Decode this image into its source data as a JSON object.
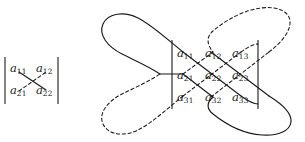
{
  "figure": {
    "background_color": "#ffffff",
    "stroke_color": "#1a1a1a",
    "text_color": "#1a1a1a",
    "solid_line_meaning": "positive products (down-right diagonals)",
    "dashed_line_meaning": "negative products (up-right diagonals)"
  },
  "determinant_2x2": {
    "name": "2x2 determinant",
    "left_bar": "|",
    "right_bar": "|",
    "rows": [
      [
        {
          "base": "a",
          "sub": "11"
        },
        {
          "base": "a",
          "sub": "12"
        }
      ],
      [
        {
          "base": "a",
          "sub": "21"
        },
        {
          "base": "a",
          "sub": "22"
        }
      ]
    ]
  },
  "determinant_3x3": {
    "name": "3x3 determinant",
    "left_bar": "|",
    "right_bar": "|",
    "rows": [
      [
        {
          "base": "a",
          "sub": "11"
        },
        {
          "base": "a",
          "sub": "12"
        },
        {
          "base": "a",
          "sub": "13"
        }
      ],
      [
        {
          "base": "a",
          "sub": "21"
        },
        {
          "base": "a",
          "sub": "22"
        },
        {
          "base": "a",
          "sub": "23"
        }
      ],
      [
        {
          "base": "a",
          "sub": "31"
        },
        {
          "base": "a",
          "sub": "32"
        },
        {
          "base": "a",
          "sub": "33"
        }
      ]
    ]
  }
}
